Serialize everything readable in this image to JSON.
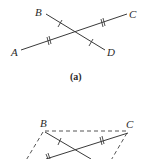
{
  "figure_a": {
    "caption": "(a)",
    "points": {
      "A": {
        "label": "A",
        "x": 19,
        "y": 51
      },
      "B": {
        "label": "B",
        "x": 45,
        "y": 13
      },
      "C": {
        "label": "C",
        "x": 127,
        "y": 14
      },
      "D": {
        "label": "D",
        "x": 105,
        "y": 50
      }
    },
    "segments": [
      {
        "from": "A",
        "to": "C",
        "style": "solid",
        "tick_marks": "double"
      },
      {
        "from": "B",
        "to": "D",
        "style": "solid",
        "tick_marks": "single"
      }
    ]
  },
  "figure_b": {
    "points": {
      "B": {
        "label": "B",
        "x": 44,
        "y": 130
      },
      "C": {
        "label": "C",
        "x": 129,
        "y": 130
      }
    },
    "segments": [
      {
        "from": "B",
        "to": "C",
        "style": "dashed"
      },
      {
        "from": "B",
        "to": "lower-left",
        "style": "dashed"
      },
      {
        "from": "C",
        "to": "lower-left",
        "style": "dashed"
      },
      {
        "from": "lower-left",
        "to": "C",
        "style": "solid",
        "tick_marks": "double"
      },
      {
        "from": "B",
        "to": "lower-right",
        "style": "solid",
        "tick_marks": "single"
      }
    ]
  }
}
